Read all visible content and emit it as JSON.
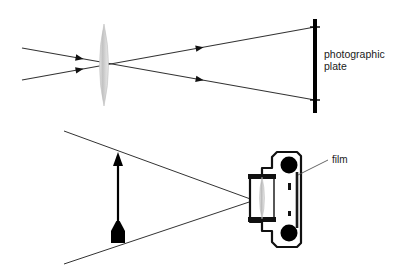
{
  "figure": {
    "background_color": "#ffffff",
    "width": 400,
    "height": 273
  },
  "colors": {
    "ray_line": "#333333",
    "outline": "#111111",
    "lens_glass": "#c9c9c9",
    "lens_glass_edge": "#b0b0b0",
    "plate_black": "#000000",
    "body_fill": "#ffffff",
    "body_stroke": "#111111",
    "spool_fill": "#000000",
    "text": "#1a1a1a",
    "leader_line": "#555555"
  },
  "top_panel": {
    "name": "lens-and-plate-diagram",
    "lens": {
      "name": "converging-lens",
      "center_x": 104,
      "center_y": 65,
      "half_width": 9,
      "half_height": 41
    },
    "plate": {
      "name": "photographic-plate",
      "x": 315,
      "y_top": 19,
      "y_bottom": 113,
      "thickness": 4,
      "label_line1": "photographic",
      "label_line2": "plate",
      "label_x": 324,
      "label_y1": 58,
      "label_y2": 70
    },
    "rays": [
      {
        "name": "ray-upper-incoming",
        "from_x": 22,
        "from_y": 48,
        "to_x": 315,
        "to_y": 100,
        "arrow_at": 0.33
      },
      {
        "name": "ray-lower-incoming",
        "from_x": 22,
        "from_y": 80,
        "to_x": 315,
        "to_y": 27,
        "arrow_at": 0.33
      }
    ],
    "hit_marks": [
      {
        "name": "plate-hit-mark-upper",
        "x": 315,
        "y": 27
      },
      {
        "name": "plate-hit-mark-lower",
        "x": 315,
        "y": 100
      }
    ]
  },
  "bottom_panel": {
    "name": "camera-cross-section-diagram",
    "object_arrow": {
      "name": "object-arrow",
      "x": 118,
      "tip_y": 152,
      "base_y": 243,
      "head_half_width": 5,
      "head_height": 14,
      "foot_half_width": 7,
      "foot_height": 22,
      "shaft_half_width": 1.1
    },
    "rays": [
      {
        "name": "ray-from-arrow-tip",
        "from_x": 64,
        "from_y": 131,
        "to_x": 297,
        "to_y": 216
      },
      {
        "name": "ray-from-arrow-base",
        "from_x": 64,
        "from_y": 264,
        "to_x": 297,
        "to_y": 186
      }
    ],
    "camera": {
      "name": "camera-body",
      "lens_barrel": {
        "name": "lens-barrel",
        "x": 250,
        "y": 175,
        "width": 24,
        "height": 46
      },
      "lens_glass": {
        "name": "camera-lens-glass",
        "center_x": 262,
        "center_y": 198,
        "half_width": 5,
        "half_height": 21
      },
      "spools": [
        {
          "name": "film-spool-top",
          "cx": 289,
          "cy": 165,
          "r": 8.5
        },
        {
          "name": "film-spool-bottom",
          "cx": 289,
          "cy": 233,
          "r": 8.5
        }
      ],
      "film_plane": {
        "name": "film-plane",
        "x": 297,
        "y_top": 172,
        "y_bottom": 228
      }
    },
    "film_label": {
      "name": "film-label",
      "text": "film",
      "text_x": 332,
      "text_y": 163,
      "leader_from_x": 328,
      "leader_from_y": 160,
      "leader_to_x": 298,
      "leader_to_y": 175
    }
  }
}
